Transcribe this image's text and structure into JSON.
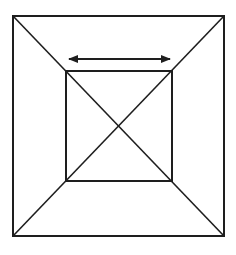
{
  "diagram": {
    "stroke_color": "#1e1e1e",
    "background": "#ffffff",
    "outer_square": {
      "x1": 13,
      "y1": 16,
      "x2": 224,
      "y2": 236
    },
    "inner_square": {
      "x1": 66,
      "y1": 71,
      "x2": 172,
      "y2": 181
    },
    "center": {
      "x": 119,
      "y": 125
    },
    "arrow": {
      "x1": 67,
      "y1": 59,
      "x2": 172,
      "y2": 59,
      "heads": "both"
    },
    "labels": []
  }
}
